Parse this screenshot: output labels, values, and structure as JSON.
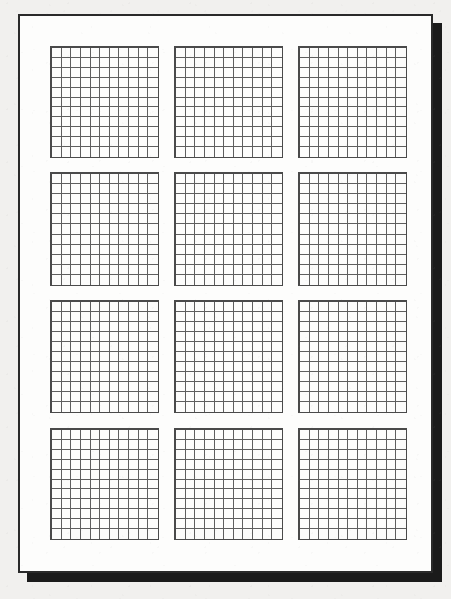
{
  "document": {
    "kind": "scanned-worksheet",
    "background_color": "#f1f0ee",
    "paper_color": "#fdfdfc",
    "paper_border_color": "#2a2a2a",
    "shadow_color": "#1b1b1b",
    "grid_line_color": "#5e5e5e",
    "grid_frame_color": "#4a4a4a",
    "page": {
      "x": 18,
      "y": 14,
      "width": 415,
      "height": 559,
      "border_width": 2
    },
    "shadow": {
      "x": 27,
      "y": 23,
      "width": 415,
      "height": 559
    }
  },
  "layout": {
    "rows": 4,
    "columns": 3,
    "blocks_total": 12,
    "column_x": [
      50,
      174,
      298
    ],
    "row_y": [
      46,
      172,
      300,
      428
    ],
    "block_width": 109,
    "block_height": 112,
    "cell_rows": 11,
    "cell_columns": 11
  },
  "blocks": [
    {
      "id": "grid-1",
      "row": 1,
      "col": 1,
      "x": 50,
      "y": 46,
      "width": 109,
      "height": 112,
      "cells_x": 11,
      "cells_y": 11
    },
    {
      "id": "grid-2",
      "row": 1,
      "col": 2,
      "x": 174,
      "y": 46,
      "width": 109,
      "height": 112,
      "cells_x": 11,
      "cells_y": 11
    },
    {
      "id": "grid-3",
      "row": 1,
      "col": 3,
      "x": 298,
      "y": 46,
      "width": 109,
      "height": 112,
      "cells_x": 11,
      "cells_y": 11
    },
    {
      "id": "grid-4",
      "row": 2,
      "col": 1,
      "x": 50,
      "y": 172,
      "width": 109,
      "height": 114,
      "cells_x": 11,
      "cells_y": 11
    },
    {
      "id": "grid-5",
      "row": 2,
      "col": 2,
      "x": 174,
      "y": 172,
      "width": 109,
      "height": 114,
      "cells_x": 11,
      "cells_y": 11
    },
    {
      "id": "grid-6",
      "row": 2,
      "col": 3,
      "x": 298,
      "y": 172,
      "width": 109,
      "height": 114,
      "cells_x": 11,
      "cells_y": 11
    },
    {
      "id": "grid-7",
      "row": 3,
      "col": 1,
      "x": 50,
      "y": 300,
      "width": 109,
      "height": 113,
      "cells_x": 11,
      "cells_y": 11
    },
    {
      "id": "grid-8",
      "row": 3,
      "col": 2,
      "x": 174,
      "y": 300,
      "width": 109,
      "height": 113,
      "cells_x": 11,
      "cells_y": 11
    },
    {
      "id": "grid-9",
      "row": 3,
      "col": 3,
      "x": 298,
      "y": 300,
      "width": 109,
      "height": 113,
      "cells_x": 11,
      "cells_y": 11
    },
    {
      "id": "grid-10",
      "row": 4,
      "col": 1,
      "x": 50,
      "y": 428,
      "width": 109,
      "height": 112,
      "cells_x": 11,
      "cells_y": 11
    },
    {
      "id": "grid-11",
      "row": 4,
      "col": 2,
      "x": 174,
      "y": 428,
      "width": 109,
      "height": 112,
      "cells_x": 11,
      "cells_y": 11
    },
    {
      "id": "grid-12",
      "row": 4,
      "col": 3,
      "x": 298,
      "y": 428,
      "width": 109,
      "height": 112,
      "cells_x": 11,
      "cells_y": 11
    }
  ]
}
